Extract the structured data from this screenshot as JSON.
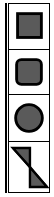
{
  "palette": {
    "title": "Shape tools",
    "colors": {
      "fill": "#5a5a5a",
      "stroke": "#000000",
      "background": "#ffffff",
      "border": "#000000"
    },
    "tools": [
      {
        "id": "rectangle",
        "icon": "rectangle-icon"
      },
      {
        "id": "rounded-rectangle",
        "icon": "rounded-rectangle-icon"
      },
      {
        "id": "ellipse",
        "icon": "ellipse-icon"
      },
      {
        "id": "bowtie",
        "icon": "bowtie-icon"
      }
    ]
  }
}
